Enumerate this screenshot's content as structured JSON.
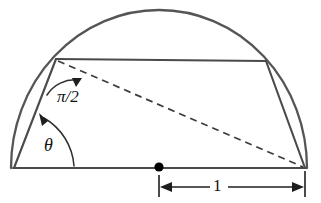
{
  "figure": {
    "type": "geometry-diagram",
    "canvas": {
      "width": 321,
      "height": 203
    },
    "colors": {
      "outline": "#4a4a4a",
      "arc": "#555555",
      "dashed": "#3c3c3c",
      "dimension": "#1e1e1e",
      "point": "#000000",
      "background": "#ffffff"
    },
    "labels": {
      "right_angle": "π/2",
      "base_angle": "θ",
      "dimension_length": "1"
    },
    "points": {
      "left_vertex": {
        "x": 14,
        "y": 168
      },
      "right_vertex": {
        "x": 305,
        "y": 168
      },
      "top_left_vertex": {
        "x": 56,
        "y": 59
      },
      "top_right_vertex": {
        "x": 266,
        "y": 61
      },
      "center_dot": {
        "x": 159,
        "y": 167
      },
      "arc_apex": {
        "x": 160,
        "y": 10
      }
    },
    "segments": {
      "baseline": "left_vertex to right_vertex",
      "left_slant": "left_vertex to top_left_vertex",
      "top_chord": "top_left_vertex to top_right_vertex",
      "right_slant": "top_right_vertex to right_vertex",
      "dashed_chord": "top_left_vertex to right_vertex"
    },
    "dimension": {
      "from_x": 159,
      "to_x": 305,
      "y": 187,
      "label": "1"
    }
  }
}
